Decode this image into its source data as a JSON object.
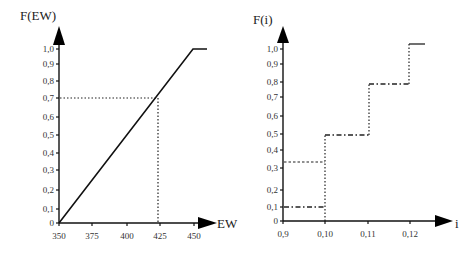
{
  "chart_data": [
    {
      "type": "line",
      "title": "",
      "ylabel": "F(EW)",
      "xlabel": "EW",
      "x_ticks": [
        "350",
        "375",
        "400",
        "425",
        "450"
      ],
      "y_ticks": [
        "0",
        "0,1",
        "0,2",
        "0,3",
        "0,4",
        "0,5",
        "0,6",
        "0,7",
        "0,8",
        "0,9",
        "1,0"
      ],
      "xlim": [
        350,
        460
      ],
      "ylim": [
        0,
        1.0
      ],
      "grid": false,
      "series": [
        {
          "name": "F(EW)",
          "style": "solid",
          "x": [
            350,
            450,
            460
          ],
          "y": [
            0,
            1.0,
            1.0
          ]
        }
      ],
      "annotations": [
        {
          "type": "dotted-guide",
          "description": "horizontal guide at F=0.7 meeting line at EW≈422, vertical drop to x-axis",
          "x": 422,
          "y": 0.7
        }
      ]
    },
    {
      "type": "line",
      "title": "",
      "ylabel": "F(i)",
      "xlabel": "i",
      "x_ticks": [
        "0,9",
        "0,10",
        "0,11",
        "0,12"
      ],
      "y_ticks": [
        "0",
        "0,1",
        "0,2",
        "0,3",
        "0,4",
        "0,5",
        "0,6",
        "0,7",
        "0,8",
        "0,9",
        "1,0"
      ],
      "xlim": [
        0.09,
        0.125
      ],
      "ylim": [
        0,
        1.0
      ],
      "grid": false,
      "series": [
        {
          "name": "step CDF",
          "style": "step",
          "segments": [
            {
              "x0": 0.09,
              "x1": 0.1,
              "y": 0.1,
              "style": "dash-dot"
            },
            {
              "x0": 0.09,
              "x1": 0.1,
              "y": 0.34,
              "style": "dashed"
            },
            {
              "x0": 0.1,
              "x1": 0.11,
              "y": 0.5,
              "style": "dash-dot"
            },
            {
              "x0": 0.11,
              "x1": 0.119,
              "y": 0.78,
              "style": "dash-dot"
            },
            {
              "x0": 0.119,
              "x1": 0.123,
              "y": 1.02,
              "style": "solid"
            }
          ],
          "jumps": [
            {
              "x": 0.1,
              "from": 0,
              "to": 0.5,
              "style": "dotted"
            },
            {
              "x": 0.11,
              "from": 0.5,
              "to": 0.78,
              "style": "dotted"
            },
            {
              "x": 0.119,
              "from": 0.78,
              "to": 1.02,
              "style": "dotted"
            }
          ]
        }
      ]
    }
  ],
  "left": {
    "ylabel": "F(EW)",
    "xlabel": "EW",
    "x_ticks": [
      {
        "label": "350",
        "px": 59
      },
      {
        "label": "375",
        "px": 92
      },
      {
        "label": "400",
        "px": 127
      },
      {
        "label": "425",
        "px": 160
      },
      {
        "label": "450",
        "px": 194
      }
    ],
    "y_ticks": [
      {
        "label": "0",
        "py": 223
      },
      {
        "label": "0,1",
        "py": 209
      },
      {
        "label": "0,2",
        "py": 190
      },
      {
        "label": "0,3",
        "py": 170
      },
      {
        "label": "0,4",
        "py": 153
      },
      {
        "label": "0,5",
        "py": 135
      },
      {
        "label": "0,6",
        "py": 117
      },
      {
        "label": "0,7",
        "py": 98
      },
      {
        "label": "0,8",
        "py": 81
      },
      {
        "label": "0,9",
        "py": 64
      },
      {
        "label": "1,0",
        "py": 49
      }
    ]
  },
  "right": {
    "ylabel": "F(i)",
    "xlabel": "i",
    "x_ticks": [
      {
        "label": "0,9",
        "px": 283
      },
      {
        "label": "0,10",
        "px": 325
      },
      {
        "label": "0,11",
        "px": 368
      },
      {
        "label": "0,12",
        "px": 410
      }
    ],
    "y_ticks": [
      {
        "label": "0",
        "py": 221
      },
      {
        "label": "0,1",
        "py": 207
      },
      {
        "label": "0,2",
        "py": 190
      },
      {
        "label": "0,3",
        "py": 168
      },
      {
        "label": "0,4",
        "py": 150
      },
      {
        "label": "0,5",
        "py": 134
      },
      {
        "label": "0,6",
        "py": 116
      },
      {
        "label": "0,7",
        "py": 97
      },
      {
        "label": "0,8",
        "py": 82
      },
      {
        "label": "0,9",
        "py": 64
      },
      {
        "label": "1,0",
        "py": 49
      }
    ]
  }
}
